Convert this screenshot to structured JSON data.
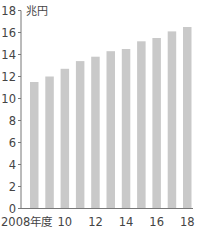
{
  "chart_data": {
    "type": "bar",
    "title": "",
    "unit_label": "兆円",
    "xlabel": "",
    "ylabel": "兆円",
    "categories": [
      "2008年度",
      "2009",
      "2010",
      "2011",
      "2012",
      "2013",
      "2014",
      "2015",
      "2016",
      "2017",
      "2018"
    ],
    "values": [
      11.5,
      12.0,
      12.7,
      13.4,
      13.8,
      14.3,
      14.5,
      15.2,
      15.5,
      16.1,
      16.5
    ],
    "x_tick_labels": [
      {
        "index": 0,
        "label": "2008年度"
      },
      {
        "index": 2,
        "label": "10"
      },
      {
        "index": 4,
        "label": "12"
      },
      {
        "index": 6,
        "label": "14"
      },
      {
        "index": 8,
        "label": "16"
      },
      {
        "index": 10,
        "label": "18"
      }
    ],
    "y_ticks": [
      0,
      2,
      4,
      6,
      8,
      10,
      12,
      14,
      16,
      18
    ],
    "ylim": [
      0,
      18
    ],
    "grid": false,
    "legend": null,
    "bar_color": "#c9c9c9"
  }
}
